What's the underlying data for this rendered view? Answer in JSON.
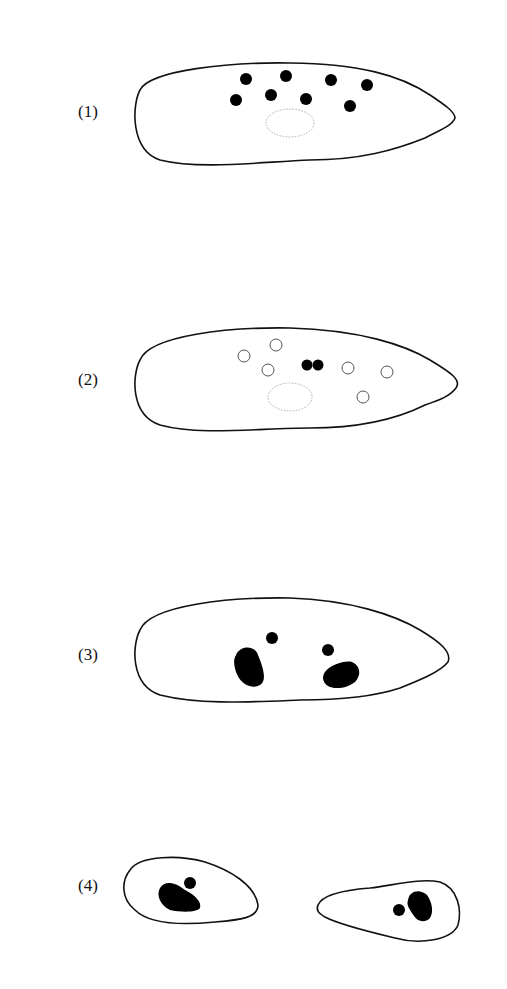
{
  "figure": {
    "panels": [
      {
        "label": "(1)",
        "description": "Cell with multiple solid micronuclei-like dots and a dotted oval region"
      },
      {
        "label": "(2)",
        "description": "Cell with hollow circles and a dividing solid pair (two fused dots), dotted oval region"
      },
      {
        "label": "(3)",
        "description": "Elongated cell with two large dark bodies and two small dots"
      },
      {
        "label": "(4)",
        "description": "Two daughter cells, each with one large dark body and one small dot"
      }
    ]
  }
}
